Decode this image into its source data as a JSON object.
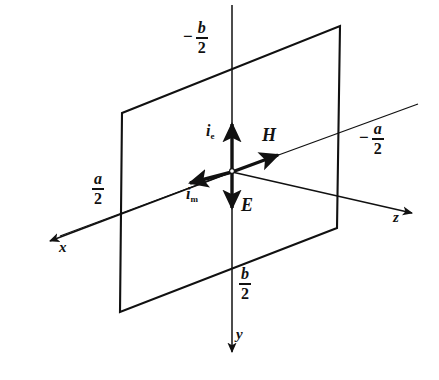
{
  "figure": {
    "background_color": "#ffffff",
    "ink_color": "#111111"
  },
  "axes": [
    {
      "name": "x-axis",
      "label": "x",
      "direction": "down-left",
      "arrow_tip": [
        46,
        243
      ],
      "label_pos": [
        60,
        243
      ]
    },
    {
      "name": "y-axis",
      "label": "y",
      "direction": "down",
      "arrow_tip": [
        232,
        355
      ],
      "label_pos": [
        238,
        330
      ]
    },
    {
      "name": "z-axis",
      "label": "z",
      "direction": "right",
      "arrow_tip": [
        416,
        213
      ],
      "label_pos": [
        394,
        212
      ]
    }
  ],
  "vectors": [
    {
      "name": "electric-current-vector",
      "label_letter": "i",
      "label_sub": "e",
      "direction": "up",
      "from": [
        232,
        172
      ],
      "to": [
        232,
        119
      ],
      "label_pos": [
        207,
        122
      ]
    },
    {
      "name": "magnetic-current-vector",
      "label_letter": "i",
      "label_sub": "m",
      "direction": "down-left",
      "from": [
        232,
        172
      ],
      "to": [
        184,
        185
      ],
      "label_pos": [
        188,
        188
      ]
    },
    {
      "name": "magnetic-field-vector",
      "label_letter": "H",
      "direction": "up-right",
      "from": [
        232,
        172
      ],
      "to": [
        281,
        154
      ],
      "label_pos": [
        262,
        128
      ]
    },
    {
      "name": "electric-field-vector",
      "label_letter": "E",
      "direction": "down",
      "from": [
        232,
        172
      ],
      "to": [
        232,
        214
      ],
      "label_pos": [
        239,
        198
      ]
    }
  ],
  "dimension_labels": [
    {
      "name": "negative-b-over-2",
      "sign": "−",
      "numerator": "b",
      "denominator": "2",
      "pos": [
        188,
        26
      ],
      "axis": "y"
    },
    {
      "name": "positive-b-over-2",
      "sign": "",
      "numerator": "b",
      "denominator": "2",
      "pos": [
        239,
        268
      ],
      "axis": "y"
    },
    {
      "name": "positive-a-over-2",
      "sign": "",
      "numerator": "a",
      "denominator": "2",
      "pos": [
        93,
        173
      ],
      "axis": "x"
    },
    {
      "name": "negative-a-over-2",
      "sign": "−",
      "numerator": "a",
      "denominator": "2",
      "pos": [
        362,
        123
      ],
      "axis": "z"
    }
  ],
  "aperture_plane": {
    "name": "aperture-rectangle",
    "corners": [
      [
        122,
        113
      ],
      [
        340,
        26
      ],
      [
        337,
        228
      ],
      [
        120,
        312
      ]
    ],
    "fill": "none",
    "stroke": "#111111"
  },
  "origin": {
    "name": "origin-point",
    "pos": [
      232,
      172
    ]
  }
}
